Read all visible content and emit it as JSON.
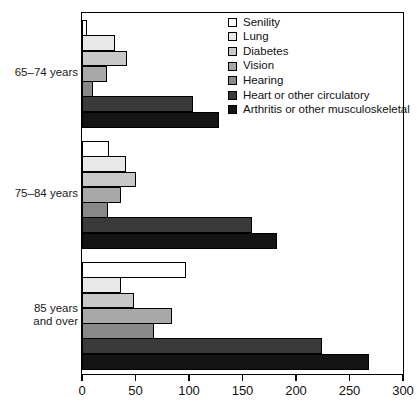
{
  "chart_data": {
    "type": "bar",
    "orientation": "horizontal",
    "title": "",
    "subtitle": "",
    "xlabel": "",
    "ylabel": "",
    "xlim": [
      0,
      300
    ],
    "xticks": [
      0,
      50,
      100,
      150,
      200,
      250,
      300
    ],
    "xtick_labels": [
      "0",
      "50",
      "100",
      "150",
      "200",
      "250",
      "300"
    ],
    "grid": false,
    "legend_position": "top-right",
    "categories": [
      "65–74 years",
      "75–84 years",
      "85 years\nand over"
    ],
    "series": [
      {
        "name": "Senility",
        "color": "#ffffff",
        "values": [
          5,
          25,
          97
        ]
      },
      {
        "name": "Lung",
        "color": "#e8e8e8",
        "values": [
          31,
          41,
          36
        ]
      },
      {
        "name": "Diabetes",
        "color": "#c8c8c8",
        "values": [
          42,
          50,
          49
        ]
      },
      {
        "name": "Vision",
        "color": "#a8a8a8",
        "values": [
          23,
          36,
          84
        ]
      },
      {
        "name": "Hearing",
        "color": "#888888",
        "values": [
          10,
          24,
          67
        ]
      },
      {
        "name": "Heart or other circulatory",
        "color": "#3a3a3a",
        "values": [
          104,
          159,
          224
        ]
      },
      {
        "name": "Arthritis or other musculoskeletal",
        "color": "#141414",
        "values": [
          128,
          182,
          268
        ]
      }
    ]
  },
  "legend": {
    "items": [
      {
        "label": "Senility",
        "color": "#ffffff"
      },
      {
        "label": "Lung",
        "color": "#e8e8e8"
      },
      {
        "label": "Diabetes",
        "color": "#c8c8c8"
      },
      {
        "label": "Vision",
        "color": "#a8a8a8"
      },
      {
        "label": "Hearing",
        "color": "#888888"
      },
      {
        "label": "Heart or other circulatory",
        "color": "#3a3a3a"
      },
      {
        "label": "Arthritis or other musculoskeletal",
        "color": "#141414"
      }
    ]
  }
}
